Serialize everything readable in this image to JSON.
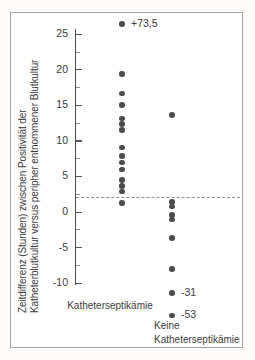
{
  "figure": {
    "background": "#fcfbf9",
    "frame_background": "#fefefe",
    "frame_border_color": "#a6a6a3"
  },
  "chart_data": {
    "type": "scatter",
    "variant": "strip-plot",
    "title": "",
    "xlabel": "",
    "ylabel_lines": [
      "Zeitdifferenz (Stunden) zwischen Positivität der",
      "Katheterblutkultur versus peripher entnommener Blutkultur"
    ],
    "y_axis": {
      "major_ticks": [
        25,
        20,
        15,
        10,
        5,
        0,
        -5,
        -10
      ],
      "minor_ticks": [
        22.5,
        17.5,
        12.5,
        7.5,
        2.5,
        -2.5,
        -7.5
      ],
      "ylim": [
        -15.8,
        27.2
      ]
    },
    "grid": false,
    "legend": null,
    "point_color": "#4c4c4c",
    "reference_line": {
      "value": 2,
      "style": "dashed",
      "color": "#8f8f8f"
    },
    "groups": [
      {
        "label": "Katheterseptikämie",
        "label_lines": [
          "Katheterseptikämie"
        ],
        "points": [
          {
            "value": 73.5,
            "plotted_at": 26.4,
            "annotation": "+73,5"
          },
          {
            "value": 19.3
          },
          {
            "value": 16.6
          },
          {
            "value": 15.0
          },
          {
            "value": 13.1
          },
          {
            "value": 12.3
          },
          {
            "value": 11.5
          },
          {
            "value": 9.0
          },
          {
            "value": 7.8
          },
          {
            "value": 6.9
          },
          {
            "value": 5.9
          },
          {
            "value": 4.4
          },
          {
            "value": 3.6
          },
          {
            "value": 2.8
          },
          {
            "value": 1.2
          }
        ]
      },
      {
        "label": "Keine Katheterseptikämie",
        "label_lines": [
          "Keine",
          "Katheterseptikämie"
        ],
        "points": [
          {
            "value": 13.6
          },
          {
            "value": 1.3
          },
          {
            "value": 0.7
          },
          {
            "value": -0.5
          },
          {
            "value": -1.1
          },
          {
            "value": -3.7
          },
          {
            "value": -8.1
          },
          {
            "value": -31,
            "plotted_at": -11.5,
            "annotation": "-31"
          },
          {
            "value": -53,
            "plotted_at": -14.6,
            "annotation": "-53"
          }
        ]
      }
    ]
  }
}
